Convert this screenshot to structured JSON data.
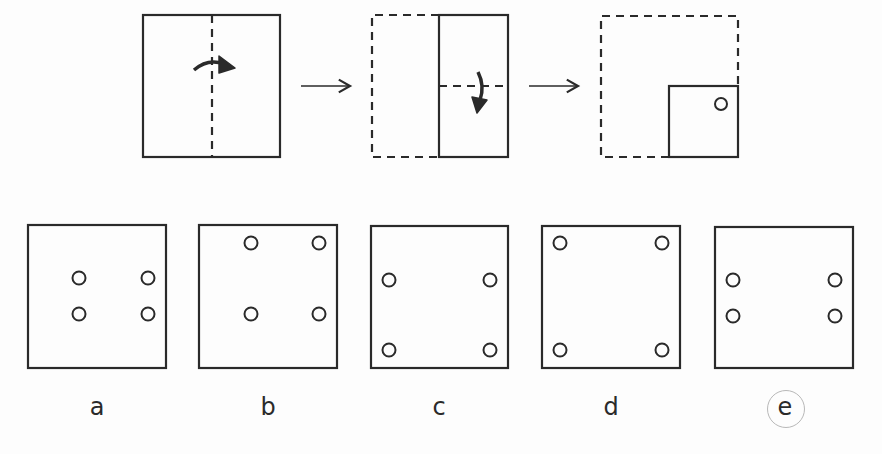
{
  "colors": {
    "background": "#fdfdfd",
    "stroke": "#2a2a2a",
    "answer_ring": "#b8b8b8"
  },
  "question": {
    "steps": [
      {
        "id": "step-1",
        "description": "Square paper with vertical dashed fold line in center; curved arrow folds left half over to the right",
        "fold_line": "vertical",
        "fold_arrow": "right"
      },
      {
        "id": "step-2",
        "description": "Folded half-width rectangle (left half dashed outline); horizontal dashed fold line; curved arrow folds top down",
        "fold_line": "horizontal",
        "fold_arrow": "down"
      },
      {
        "id": "step-3",
        "description": "Quarter-size folded square in bottom-right of dashed outline with one hole punched near its top-right",
        "holes": 1
      }
    ],
    "arrows": [
      "right-arrow",
      "right-arrow"
    ]
  },
  "options": [
    {
      "label": "a",
      "holes": [
        [
          79,
          278
        ],
        [
          148,
          278
        ],
        [
          79,
          314
        ],
        [
          148,
          314
        ]
      ]
    },
    {
      "label": "b",
      "holes": [
        [
          251,
          243
        ],
        [
          319,
          243
        ],
        [
          251,
          314
        ],
        [
          319,
          314
        ]
      ]
    },
    {
      "label": "c",
      "holes": [
        [
          389,
          280
        ],
        [
          490,
          280
        ],
        [
          389,
          350
        ],
        [
          490,
          350
        ]
      ]
    },
    {
      "label": "d",
      "holes": [
        [
          560,
          243
        ],
        [
          660,
          243
        ],
        [
          560,
          350
        ],
        [
          660,
          350
        ]
      ]
    },
    {
      "label": "e",
      "holes": [
        [
          733,
          280
        ],
        [
          835,
          280
        ],
        [
          733,
          316
        ],
        [
          835,
          316
        ]
      ],
      "selected": true
    }
  ],
  "answer": "e"
}
